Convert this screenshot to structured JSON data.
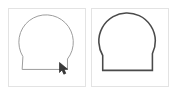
{
  "app": {
    "title": "Drawing Comparison",
    "background_color": "#ffffff"
  },
  "panels": [
    {
      "id": "panel-left",
      "name": "in-progress-drawing-panel",
      "label": "In-progress sketch",
      "border_color": "#e3e3e3",
      "canvas_color": "#ffffff",
      "stroke_color": "#9a9a9a",
      "stroke_width": 1,
      "state": "drawing",
      "has_cursor": true,
      "cursor": {
        "icon": "pen-cursor-icon",
        "x": 62,
        "y": 62,
        "color": "#3b3b3b"
      },
      "shape": {
        "name": "q-glyph",
        "description": "circle with flat lower-left baseline and notched tail at lower right",
        "circle": {
          "cx": 38,
          "cy": 34,
          "r": 28
        },
        "baseline_y": 62,
        "baseline_x_start": 14,
        "baseline_x_end": 60,
        "notch_x": 60,
        "notch_top_y": 51
      }
    },
    {
      "id": "panel-right",
      "name": "finished-drawing-panel",
      "label": "Finished sketch",
      "border_color": "#e3e3e3",
      "canvas_color": "#ffffff",
      "stroke_color": "#4a4a4a",
      "stroke_width": 1.6,
      "state": "complete",
      "has_cursor": false,
      "shape": {
        "name": "q-glyph",
        "description": "circle with flat lower-left baseline and notched tail at lower right",
        "circle": {
          "cx": 36,
          "cy": 33,
          "r": 29
        },
        "baseline_y": 63,
        "baseline_x_start": 11,
        "baseline_x_end": 62,
        "notch_x": 62,
        "notch_top_y": 52
      }
    }
  ]
}
